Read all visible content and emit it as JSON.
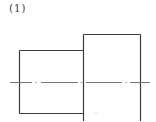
{
  "figure": {
    "label": "(1)"
  },
  "drawing": {
    "stroke_color": "#3a3a3a",
    "centerline_color": "#7a7a7a",
    "small_rect": {
      "x": 19,
      "y": 50,
      "width": 64,
      "height": 63
    },
    "large_rect": {
      "x": 83,
      "y": 34,
      "width": 57,
      "height": 90
    },
    "centerline": {
      "y": 82,
      "x1": 10,
      "x2": 150
    }
  }
}
